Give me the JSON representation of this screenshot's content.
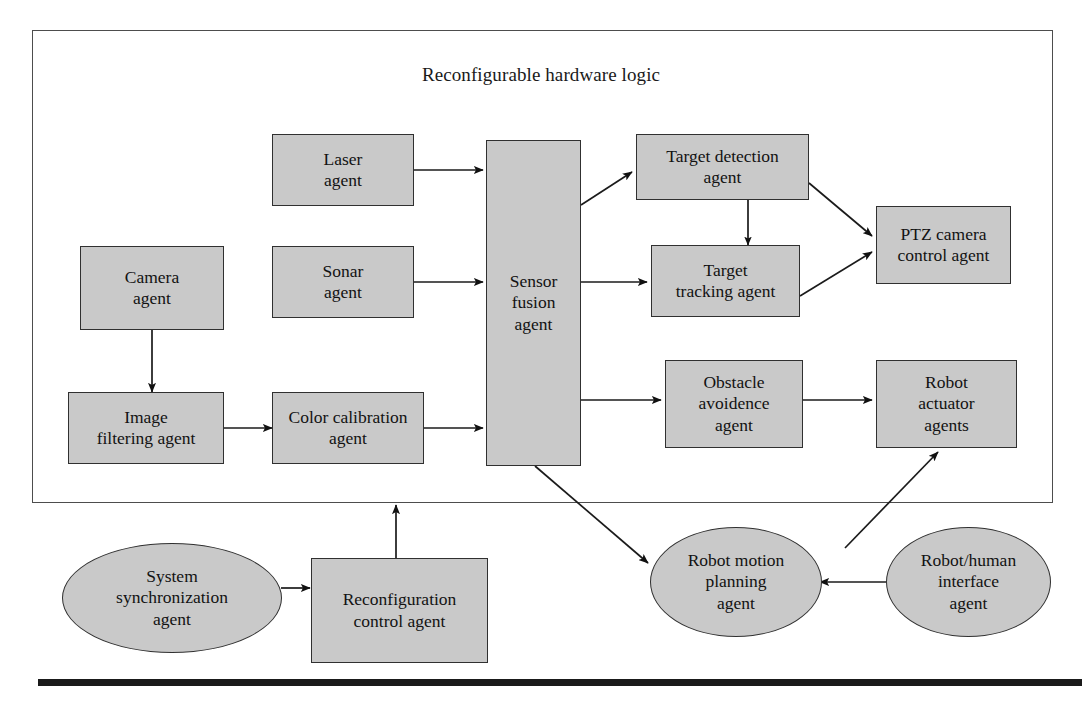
{
  "diagram": {
    "title": "Reconfigurable hardware logic",
    "frame_label": "Reconfigurable hardware logic",
    "colors": {
      "node_fill": "#c9c9c9",
      "node_stroke": "#303030",
      "frame_stroke": "#4d4d4d",
      "text": "#121212",
      "rule": "#1a1a1a"
    },
    "nodes": [
      {
        "id": "laser",
        "shape": "rect",
        "label": "Laser\nagent"
      },
      {
        "id": "camera",
        "shape": "rect",
        "label": "Camera\nagent"
      },
      {
        "id": "sonar",
        "shape": "rect",
        "label": "Sonar\nagent"
      },
      {
        "id": "image_filter",
        "shape": "rect",
        "label": "Image\nfiltering agent"
      },
      {
        "id": "color_cal",
        "shape": "rect",
        "label": "Color calibration\nagent"
      },
      {
        "id": "sensor_fusion",
        "shape": "rect",
        "label": "Sensor\nfusion\nagent"
      },
      {
        "id": "target_detect",
        "shape": "rect",
        "label": "Target  detection\nagent"
      },
      {
        "id": "target_track",
        "shape": "rect",
        "label": "Target\ntracking agent"
      },
      {
        "id": "ptz",
        "shape": "rect",
        "label": "PTZ camera\ncontrol agent"
      },
      {
        "id": "obstacle",
        "shape": "rect",
        "label": "Obstacle\navoidence\nagent"
      },
      {
        "id": "actuator",
        "shape": "rect",
        "label": "Robot\nactuator\nagents"
      },
      {
        "id": "sys_sync",
        "shape": "ellipse",
        "label": "System\nsynchronization\nagent"
      },
      {
        "id": "reconfig",
        "shape": "rect",
        "label": "Reconfiguration\ncontrol agent"
      },
      {
        "id": "motion_plan",
        "shape": "ellipse",
        "label": "Robot motion\nplanning\nagent"
      },
      {
        "id": "robot_human",
        "shape": "ellipse",
        "label": "Robot/human\ninterface\nagent"
      }
    ],
    "edges": [
      {
        "from": "laser",
        "to": "sensor_fusion",
        "style": "arrow"
      },
      {
        "from": "sonar",
        "to": "sensor_fusion",
        "style": "arrow"
      },
      {
        "from": "camera",
        "to": "image_filter",
        "style": "arrow"
      },
      {
        "from": "image_filter",
        "to": "color_cal",
        "style": "arrow"
      },
      {
        "from": "color_cal",
        "to": "sensor_fusion",
        "style": "arrow"
      },
      {
        "from": "sensor_fusion",
        "to": "target_detect",
        "style": "arrow"
      },
      {
        "from": "sensor_fusion",
        "to": "target_track",
        "style": "arrow"
      },
      {
        "from": "sensor_fusion",
        "to": "obstacle",
        "style": "arrow"
      },
      {
        "from": "sensor_fusion",
        "to": "motion_plan",
        "style": "arrow"
      },
      {
        "from": "target_detect",
        "to": "target_track",
        "style": "double-arrow"
      },
      {
        "from": "target_detect",
        "to": "ptz",
        "style": "arrow"
      },
      {
        "from": "target_track",
        "to": "ptz",
        "style": "arrow"
      },
      {
        "from": "obstacle",
        "to": "actuator",
        "style": "arrow"
      },
      {
        "from": "motion_plan",
        "to": "actuator",
        "style": "arrow"
      },
      {
        "from": "robot_human",
        "to": "motion_plan",
        "style": "arrow"
      },
      {
        "from": "sys_sync",
        "to": "reconfig",
        "style": "arrow"
      },
      {
        "from": "reconfig",
        "to": "frame",
        "style": "arrow"
      }
    ]
  }
}
